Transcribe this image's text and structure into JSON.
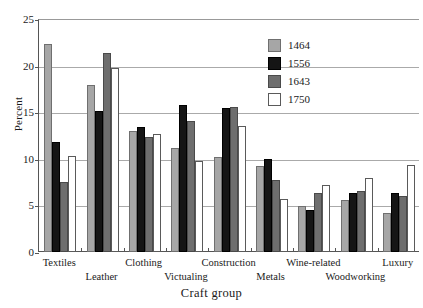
{
  "chart_data": {
    "type": "bar",
    "title": "",
    "subtitle": "",
    "xlabel": "Craft group",
    "ylabel": "Percent",
    "ylim": [
      0,
      25
    ],
    "yticks": [
      0,
      5,
      10,
      15,
      20,
      25
    ],
    "grid": true,
    "legend_position": "upper right",
    "categories": [
      "Textiles",
      "Leather",
      "Clothing",
      "Victualing",
      "Construction",
      "Metals",
      "Wine-related",
      "Woodworking",
      "Luxury"
    ],
    "series": [
      {
        "name": "1464",
        "color": "#a6a6a6",
        "values": [
          22.3,
          17.9,
          13.0,
          11.2,
          10.2,
          9.2,
          4.9,
          5.6,
          4.2
        ]
      },
      {
        "name": "1556",
        "color": "#151515",
        "values": [
          11.8,
          15.1,
          13.4,
          15.8,
          15.4,
          10.0,
          4.5,
          6.3,
          6.3
        ]
      },
      {
        "name": "1643",
        "color": "#6e6e6e",
        "values": [
          7.5,
          21.3,
          12.3,
          14.1,
          15.6,
          7.7,
          6.3,
          6.6,
          6.0
        ]
      },
      {
        "name": "1750",
        "color": "#ffffff",
        "values": [
          10.3,
          19.7,
          12.7,
          9.8,
          13.5,
          5.7,
          7.2,
          7.9,
          9.3
        ]
      }
    ]
  },
  "legend": {
    "entries": [
      {
        "label": "1464"
      },
      {
        "label": "1556"
      },
      {
        "label": "1643"
      },
      {
        "label": "1750"
      }
    ]
  },
  "axes": {
    "y_title": "Percent",
    "x_title": "Craft group",
    "y_tick_labels": [
      "0",
      "5",
      "10",
      "15",
      "20",
      "25"
    ]
  }
}
